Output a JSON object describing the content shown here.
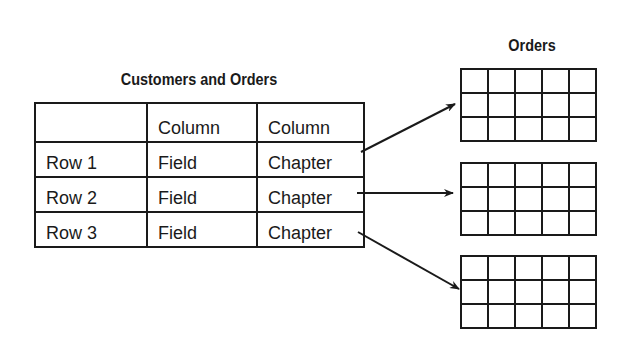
{
  "diagram": {
    "main_table": {
      "title": "Customers and Orders",
      "header": [
        "",
        "Column",
        "Column"
      ],
      "rows": [
        [
          "Row 1",
          "Field",
          "Chapter"
        ],
        [
          "Row 2",
          "Field",
          "Chapter"
        ],
        [
          "Row 3",
          "Field",
          "Chapter"
        ]
      ]
    },
    "orders": {
      "title": "Orders",
      "tables": [
        {
          "rows": 3,
          "cols": 5
        },
        {
          "rows": 3,
          "cols": 5
        },
        {
          "rows": 3,
          "cols": 5
        }
      ]
    },
    "links": [
      {
        "from": "Row 1",
        "to": "orders-table-1"
      },
      {
        "from": "Row 2",
        "to": "orders-table-2"
      },
      {
        "from": "Row 3",
        "to": "orders-table-3"
      }
    ],
    "colors": {
      "line": "#1a1a1a",
      "background": "#ffffff"
    }
  }
}
